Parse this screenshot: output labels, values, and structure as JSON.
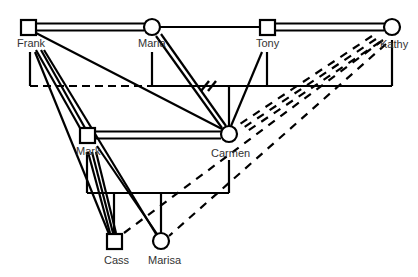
{
  "diagram": {
    "type": "genogram",
    "colors": {
      "line": "#000000",
      "label": "#333333",
      "background": "#ffffff"
    },
    "people": [
      {
        "id": "frank",
        "name": "Frank",
        "sex": "male",
        "shape": "square",
        "x": 28,
        "y": 27
      },
      {
        "id": "maria",
        "name": "Maria",
        "sex": "female",
        "shape": "circle",
        "x": 152,
        "y": 27
      },
      {
        "id": "tony",
        "name": "Tony",
        "sex": "male",
        "shape": "square",
        "x": 267,
        "y": 27
      },
      {
        "id": "kathy",
        "name": "Kathy",
        "sex": "female",
        "shape": "circle",
        "x": 392,
        "y": 27
      },
      {
        "id": "mark",
        "name": "Mark",
        "sex": "male",
        "shape": "square",
        "x": 87,
        "y": 135
      },
      {
        "id": "carmen",
        "name": "Carmen",
        "sex": "female",
        "shape": "circle",
        "x": 229,
        "y": 134
      },
      {
        "id": "cass",
        "name": "Cass",
        "sex": "male",
        "shape": "square",
        "x": 114,
        "y": 241
      },
      {
        "id": "marisa",
        "name": "Marisa",
        "sex": "female",
        "shape": "circle",
        "x": 161,
        "y": 241
      }
    ],
    "unions": [
      {
        "a": "Frank",
        "b": "Maria",
        "style": "double"
      },
      {
        "a": "Maria",
        "b": "Tony",
        "style": "single"
      },
      {
        "a": "Tony",
        "b": "Kathy",
        "style": "double"
      },
      {
        "a": "Mark",
        "b": "Carmen",
        "style": "double"
      }
    ],
    "relationships": [
      {
        "from": "Frank",
        "to": "Mark",
        "style": "double"
      },
      {
        "from": "Frank",
        "to": "Carmen",
        "style": "single"
      },
      {
        "from": "Frank",
        "to": "Cass",
        "style": "single"
      },
      {
        "from": "Frank",
        "to": "Marisa",
        "style": "single"
      },
      {
        "from": "Maria",
        "to": "Carmen",
        "style": "double"
      },
      {
        "from": "Tony",
        "to": "Carmen",
        "style": "single"
      },
      {
        "from": "Mark",
        "to": "Cass",
        "style": "triple"
      },
      {
        "from": "Mark",
        "to": "Marisa",
        "style": "single"
      },
      {
        "from": "Kathy",
        "to": "Carmen",
        "style": "dashed-triple"
      },
      {
        "from": "Kathy",
        "to": "Cass",
        "style": "dashed"
      },
      {
        "from": "Kathy",
        "to": "Marisa",
        "style": "dashed"
      }
    ],
    "sibship_lines": [
      {
        "parents": "Frank, Maria, Tony, Kathy",
        "child": "Carmen",
        "y": 86,
        "marker": "double-slash"
      },
      {
        "parents": "Mark, Carmen",
        "children": [
          "Cass",
          "Marisa"
        ],
        "y": 193
      }
    ]
  }
}
